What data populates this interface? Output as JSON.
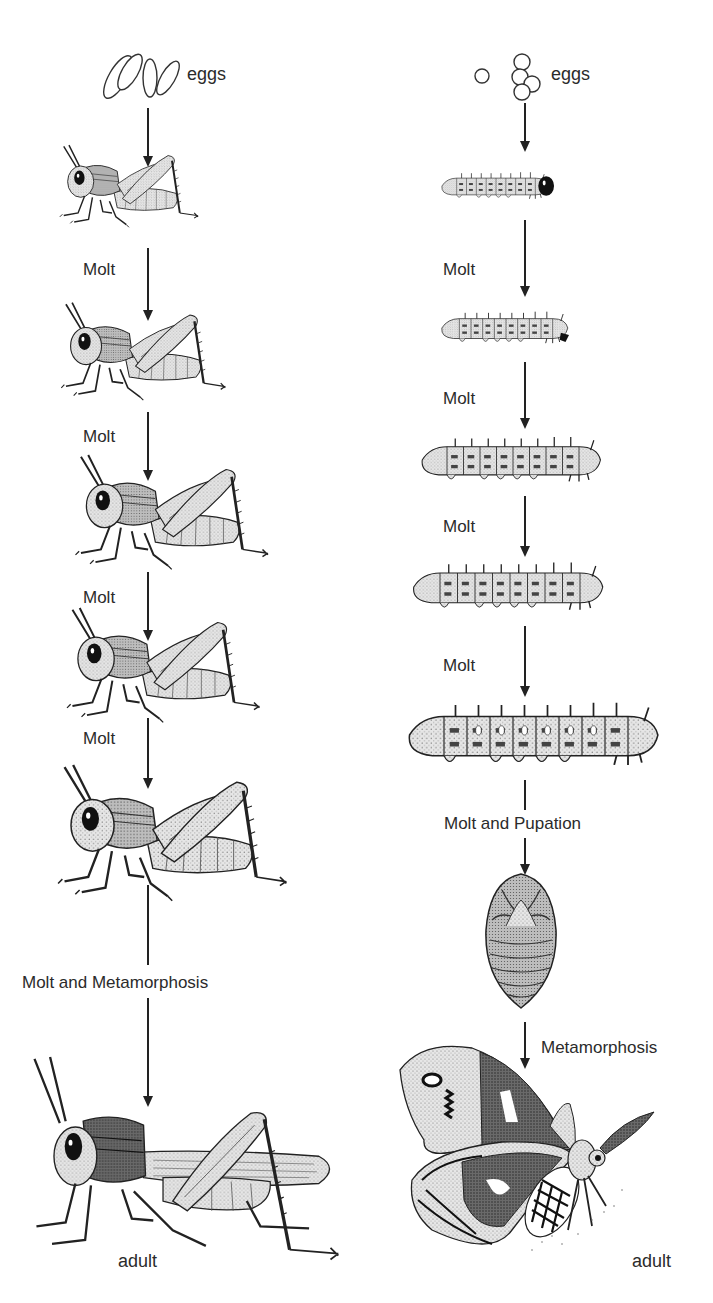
{
  "diagram": {
    "type": "life-cycle-comparison",
    "left_column": {
      "subject": "grasshopper",
      "development": "incomplete metamorphosis",
      "stages": [
        {
          "id": "eggs",
          "label": "eggs"
        },
        {
          "id": "nymph-1",
          "label": ""
        },
        {
          "id": "nymph-2",
          "label": ""
        },
        {
          "id": "nymph-3",
          "label": ""
        },
        {
          "id": "nymph-4",
          "label": ""
        },
        {
          "id": "nymph-5",
          "label": ""
        },
        {
          "id": "adult",
          "label": "adult"
        }
      ],
      "transitions": [
        "",
        "Molt",
        "Molt",
        "Molt",
        "Molt",
        "Molt and Metamorphosis"
      ]
    },
    "right_column": {
      "subject": "moth",
      "development": "complete metamorphosis",
      "stages": [
        {
          "id": "eggs",
          "label": "eggs"
        },
        {
          "id": "larva-1",
          "label": ""
        },
        {
          "id": "larva-2",
          "label": ""
        },
        {
          "id": "larva-3",
          "label": ""
        },
        {
          "id": "larva-4",
          "label": ""
        },
        {
          "id": "larva-5",
          "label": ""
        },
        {
          "id": "pupa",
          "label": ""
        },
        {
          "id": "adult",
          "label": "adult"
        }
      ],
      "transitions": [
        "",
        "Molt",
        "Molt",
        "Molt",
        "Molt",
        "Molt and Pupation",
        "Metamorphosis"
      ]
    }
  },
  "labels": {
    "left_eggs": "eggs",
    "left_molt_1": "Molt",
    "left_molt_2": "Molt",
    "left_molt_3": "Molt",
    "left_molt_4": "Molt",
    "left_metamorphosis": "Molt and Metamorphosis",
    "left_adult": "adult",
    "right_eggs": "eggs",
    "right_molt_1": "Molt",
    "right_molt_2": "Molt",
    "right_molt_3": "Molt",
    "right_molt_4": "Molt",
    "right_pupation": "Molt and Pupation",
    "right_metamorphosis": "Metamorphosis",
    "right_adult": "adult"
  },
  "colors": {
    "ink": "#222222",
    "fill_light": "#d9d9d9",
    "fill_mid": "#a8a8a8",
    "fill_dark": "#3a3a3a",
    "background": "#ffffff"
  }
}
